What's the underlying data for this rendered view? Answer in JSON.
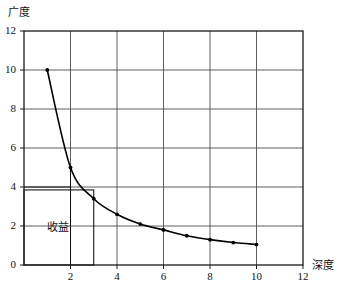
{
  "chart_data": {
    "type": "line",
    "title": "",
    "xlabel": "深度",
    "ylabel": "广度",
    "xlim": [
      0,
      12
    ],
    "ylim": [
      0,
      12
    ],
    "grid": true,
    "grid_step_x": 2,
    "grid_step_y": 2,
    "legend": "none",
    "x_ticks": [
      "2",
      "4",
      "6",
      "8",
      "10",
      "12"
    ],
    "x_tick_values": [
      2,
      4,
      6,
      8,
      10,
      12
    ],
    "y_ticks": [
      "0",
      "2",
      "4",
      "6",
      "8",
      "10",
      "12"
    ],
    "y_tick_values": [
      0,
      2,
      4,
      6,
      8,
      10,
      12
    ],
    "series": [
      {
        "name": "广度-深度曲线",
        "marker": "dot",
        "color": "#000000",
        "x": [
          1,
          2,
          3,
          4,
          5,
          6,
          7,
          8,
          9,
          10
        ],
        "values": [
          10,
          5,
          3.4,
          2.6,
          2.1,
          1.8,
          1.5,
          1.3,
          1.15,
          1.05
        ]
      }
    ],
    "annotations": [
      {
        "name": "收益",
        "label": "收益",
        "type": "rectangle",
        "x0": 0,
        "y0": 0,
        "x1": 3,
        "y1": 3.85,
        "label_x": 1.5,
        "label_y": 2
      },
      {
        "name": "指示线-x2",
        "type": "vline",
        "x": 2,
        "y0": 0,
        "y1": 5
      },
      {
        "name": "指示线-y4",
        "type": "hline",
        "y": 4,
        "x0": 0,
        "x1": 2
      }
    ]
  },
  "axes": {
    "y_title": "广度",
    "x_title": "深度"
  },
  "region": {
    "label": "收益"
  }
}
